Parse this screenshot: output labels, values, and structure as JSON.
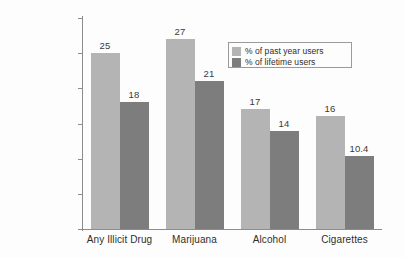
{
  "chart_data": {
    "type": "bar",
    "title": "",
    "xlabel": "",
    "ylabel": "",
    "ylim": [
      0,
      30
    ],
    "yticks": [
      0,
      5,
      10,
      15,
      20,
      25,
      30
    ],
    "grid": false,
    "legend_position": "upper-right-inside",
    "categories": [
      "Any Illicit Drug",
      "Marijuana",
      "Alcohol",
      "Cigarettes"
    ],
    "series": [
      {
        "name": "% of past year users",
        "color": "#b4b4b4",
        "values": [
          25,
          27,
          17,
          16
        ],
        "labels": [
          "25",
          "27",
          "17",
          "16"
        ]
      },
      {
        "name": "% of lifetime users",
        "color": "#7d7d7d",
        "values": [
          18,
          21,
          14,
          10.4
        ],
        "labels": [
          "18",
          "21",
          "14",
          "10.4"
        ]
      }
    ]
  },
  "axis": {
    "tick_labels": [
      "30",
      "25",
      "20",
      "15",
      "10",
      "5",
      "0"
    ]
  },
  "legend": {
    "entries": [
      {
        "label": "% of past year users",
        "color": "#b4b4b4"
      },
      {
        "label": "% of lifetime users",
        "color": "#7d7d7d"
      }
    ]
  }
}
